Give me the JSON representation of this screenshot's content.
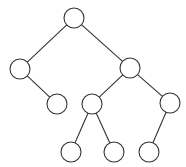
{
  "diagram": {
    "type": "binary-tree",
    "colors": {
      "stroke": "#333333",
      "fill": "#ffffff",
      "background": "#ffffff"
    },
    "node_radius": 10,
    "nodes": [
      {
        "id": "root",
        "x": 74,
        "y": 18
      },
      {
        "id": "L",
        "x": 20,
        "y": 69
      },
      {
        "id": "R",
        "x": 130,
        "y": 68
      },
      {
        "id": "LR",
        "x": 57,
        "y": 104
      },
      {
        "id": "RL",
        "x": 92,
        "y": 104
      },
      {
        "id": "RR",
        "x": 170,
        "y": 103
      },
      {
        "id": "RLL",
        "x": 71,
        "y": 152
      },
      {
        "id": "RLR",
        "x": 114,
        "y": 152
      },
      {
        "id": "RRL",
        "x": 149,
        "y": 152
      }
    ],
    "edges": [
      [
        "root",
        "L"
      ],
      [
        "root",
        "R"
      ],
      [
        "L",
        "LR"
      ],
      [
        "R",
        "RL"
      ],
      [
        "R",
        "RR"
      ],
      [
        "RL",
        "RLL"
      ],
      [
        "RL",
        "RLR"
      ],
      [
        "RR",
        "RRL"
      ]
    ]
  }
}
